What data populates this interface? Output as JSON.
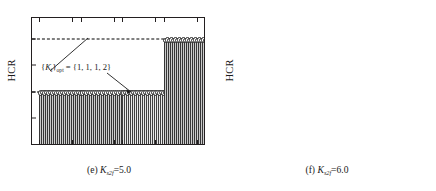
{
  "figure": {
    "panels": [
      {
        "id": "e",
        "caption_prefix": "(e)",
        "caption_symbol": "K",
        "caption_sub": "s2f",
        "caption_value": "=5.0",
        "ylabel": "HCR",
        "yticks": [
          "0",
          "0.5",
          "1.0",
          "1.5",
          "2.0",
          "2.4"
        ],
        "xticks": [
          "B1",
          "B2",
          "B3",
          "B4"
        ],
        "annotation_lead": "{",
        "annotation_symbol": "K",
        "annotation_mid": "}",
        "annotation_sub": "opt",
        "annotation_tail": " = {1, 1, 1, 2}",
        "annotation_full": "{Ki}opt = {1, 1, 1, 2}"
      },
      {
        "id": "f",
        "caption_prefix": "(f)",
        "caption_symbol": "K",
        "caption_sub": "s2f",
        "caption_value": "=6.0",
        "ylabel": "HCR",
        "yticks": [
          "0",
          "1.0",
          "2.0",
          "3.0",
          "3.4"
        ],
        "xticks": [
          "B1",
          "B2",
          "B3",
          "B4"
        ],
        "annotation_lead": "{",
        "annotation_symbol": "K",
        "annotation_mid": "}",
        "annotation_sub": "opt",
        "annotation_tail": " = {1, 1, 1, 3}",
        "annotation_full": "{Ki}opt = {1, 1, 1, 3}"
      }
    ]
  },
  "chart_data": [
    {
      "type": "bar",
      "panel": "(e) Ks2f=5.0",
      "title": "",
      "xlabel": "",
      "ylabel": "HCR",
      "ylim": [
        0,
        2.4
      ],
      "yticks": [
        0,
        0.5,
        1.0,
        1.5,
        2.0,
        2.4
      ],
      "grid": false,
      "legend": "none",
      "categories": [
        "B1",
        "B2",
        "B3",
        "B4"
      ],
      "values": [
        1.0,
        1.0,
        1.0,
        2.0
      ],
      "group_bar_counts": [
        22,
        22,
        22,
        22
      ],
      "group_colors": [
        "#8f8f8f",
        "#8f8f8f",
        "#c9c9c9",
        "#8a8a8a"
      ],
      "reference_lines": [
        1.0,
        2.0
      ],
      "marker": "circle-at-bar-top",
      "annotations": [
        {
          "text": "{Ki}opt = {1, 1, 1, 2}",
          "points_to": [
            "B1 top",
            "B4 top"
          ]
        }
      ]
    },
    {
      "type": "bar",
      "panel": "(f) Ks2f=6.0",
      "title": "",
      "xlabel": "",
      "ylabel": "HCR",
      "ylim": [
        0,
        3.4
      ],
      "yticks": [
        0,
        1.0,
        2.0,
        3.0,
        3.4
      ],
      "grid": false,
      "legend": "none",
      "categories": [
        "B1",
        "B2",
        "B3",
        "B4"
      ],
      "values": [
        1.0,
        1.0,
        1.0,
        3.0
      ],
      "group_bar_counts": [
        22,
        22,
        22,
        22
      ],
      "group_colors": [
        "#8f8f8f",
        "#8f8f8f",
        "#c9c9c9",
        "#8a8a8a"
      ],
      "reference_lines": [
        1.0,
        3.0
      ],
      "marker": "circle-at-bar-top",
      "annotations": [
        {
          "text": "{Ki}opt = {1, 1, 1, 3}",
          "points_to": [
            "B1 top",
            "B4 top"
          ]
        }
      ]
    }
  ]
}
